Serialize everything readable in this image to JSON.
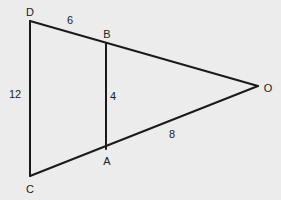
{
  "diagram": {
    "type": "similar-triangles",
    "background": "#ececec",
    "stroke_color": "#1a1a1a",
    "points": {
      "D": {
        "label": "D",
        "x": 30,
        "y": 21,
        "label_x": 30,
        "label_y": 12
      },
      "B": {
        "label": "B",
        "x": 106,
        "y": 43,
        "label_x": 107,
        "label_y": 34
      },
      "O": {
        "label": "O",
        "x": 258,
        "y": 86,
        "label_x": 268,
        "label_y": 88
      },
      "A": {
        "label": "A",
        "x": 106,
        "y": 149,
        "label_x": 107,
        "label_y": 161
      },
      "C": {
        "label": "C",
        "x": 30,
        "y": 176,
        "label_x": 30,
        "label_y": 189
      }
    },
    "segments": [
      {
        "from": "D",
        "to": "O"
      },
      {
        "from": "C",
        "to": "O"
      },
      {
        "from": "D",
        "to": "C"
      },
      {
        "from": "B",
        "to": "A"
      }
    ],
    "measurements": [
      {
        "segment": "DB",
        "value": "6",
        "x": 70,
        "y": 20
      },
      {
        "segment": "DC",
        "value": "12",
        "x": 15,
        "y": 94
      },
      {
        "segment": "BA",
        "value": "4",
        "x": 113,
        "y": 96
      },
      {
        "segment": "AO",
        "value": "8",
        "x": 172,
        "y": 134
      }
    ]
  }
}
